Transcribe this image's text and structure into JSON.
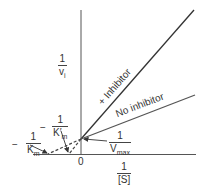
{
  "diagram": {
    "type": "Lineweaver-Burk plot (competitive inhibition)",
    "y_axis_label": {
      "numerator": "1",
      "denominator": "v",
      "subscript": "i"
    },
    "x_axis_label": {
      "numerator": "1",
      "denominator": "[S]"
    },
    "origin_label": "0",
    "lines": [
      {
        "name": "+ Inhibitor",
        "label": "+ Inhibitor",
        "color": "#333333"
      },
      {
        "name": "No inhibitor",
        "label": "No inhibitor",
        "color": "#444444"
      }
    ],
    "annotations": {
      "vmax": {
        "numerator": "1",
        "denominator": "V",
        "subscript": "max"
      },
      "km": {
        "sign": "−",
        "numerator": "1",
        "denominator": "K",
        "subscript": "m"
      },
      "km_prime": {
        "sign": "−",
        "numerator": "1",
        "denominator": "K′",
        "subscript": "m"
      }
    }
  }
}
